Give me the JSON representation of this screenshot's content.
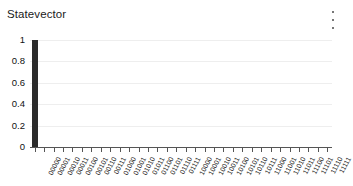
{
  "header": {
    "title": "Statevector",
    "menu_icon": "kebab-menu-icon"
  },
  "chart_data": {
    "type": "bar",
    "title": "Statevector",
    "xlabel": "",
    "ylabel": "",
    "ylim": [
      0,
      1
    ],
    "y_ticks": [
      "0",
      "0.2",
      "0.4",
      "0.6",
      "0.8",
      "1"
    ],
    "y_tick_values": [
      0,
      0.2,
      0.4,
      0.6,
      0.8,
      1
    ],
    "grid": "horizontal",
    "legend": "none",
    "bar_color": "#2b2b2b",
    "grid_color": "#eeeeee",
    "axis_color": "#555555",
    "categories": [
      "00000",
      "00001",
      "00010",
      "00011",
      "00100",
      "00101",
      "00110",
      "00111",
      "01000",
      "01001",
      "01010",
      "01011",
      "01100",
      "01101",
      "01110",
      "01111",
      "10000",
      "10001",
      "10010",
      "10011",
      "10100",
      "10101",
      "10110",
      "10111",
      "11000",
      "11001",
      "11010",
      "11011",
      "11100",
      "11101",
      "11110",
      "11111"
    ],
    "values": [
      1,
      0,
      0,
      0,
      0,
      0,
      0,
      0,
      0,
      0,
      0,
      0,
      0,
      0,
      0,
      0,
      0,
      0,
      0,
      0,
      0,
      0,
      0,
      0,
      0,
      0,
      0,
      0,
      0,
      0,
      0,
      0
    ]
  }
}
